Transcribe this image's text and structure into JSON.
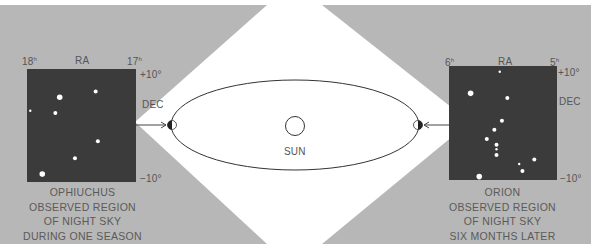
{
  "colors": {
    "background_gray": "#b7b7b7",
    "sky_panel": "#3b3b3b",
    "star": "#ffffff",
    "light_cone": "#ffffff",
    "orbit_line": "#444444",
    "text": "#555555"
  },
  "center": {
    "sun_label": "SUN"
  },
  "left_panel": {
    "ra_label": "RA",
    "ra_left_tick": "18",
    "ra_right_tick": "17",
    "ra_unit": "h",
    "dec_label": "DEC",
    "dec_top_tick": "+10°",
    "dec_bottom_tick": "−10°",
    "caption_lines": [
      "OPHIUCHUS",
      "OBSERVED REGION",
      "OF NIGHT SKY",
      "DURING ONE SEASON"
    ],
    "stars": [
      {
        "x": 0.3,
        "y": 0.25,
        "mag": 3
      },
      {
        "x": 0.63,
        "y": 0.2,
        "mag": 2
      },
      {
        "x": 0.03,
        "y": 0.37,
        "mag": 1
      },
      {
        "x": 0.26,
        "y": 0.39,
        "mag": 2
      },
      {
        "x": 0.65,
        "y": 0.64,
        "mag": 2
      },
      {
        "x": 0.44,
        "y": 0.79,
        "mag": 2
      },
      {
        "x": 0.14,
        "y": 0.93,
        "mag": 3
      }
    ]
  },
  "right_panel": {
    "ra_label": "RA",
    "ra_left_tick": "6",
    "ra_right_tick": "5",
    "ra_unit": "h",
    "dec_label": "DEC",
    "dec_top_tick": "+10°",
    "dec_bottom_tick": "−10°",
    "caption_lines": [
      "ORION",
      "OBSERVED REGION",
      "OF NIGHT SKY",
      "SIX MONTHS LATER"
    ],
    "stars": [
      {
        "x": 0.47,
        "y": 0.05,
        "mag": 1
      },
      {
        "x": 0.2,
        "y": 0.24,
        "mag": 3
      },
      {
        "x": 0.54,
        "y": 0.28,
        "mag": 2
      },
      {
        "x": 0.49,
        "y": 0.48,
        "mag": 2
      },
      {
        "x": 0.42,
        "y": 0.56,
        "mag": 2
      },
      {
        "x": 0.35,
        "y": 0.64,
        "mag": 2
      },
      {
        "x": 0.44,
        "y": 0.69,
        "mag": 2
      },
      {
        "x": 0.44,
        "y": 0.73,
        "mag": 1
      },
      {
        "x": 0.44,
        "y": 0.78,
        "mag": 2
      },
      {
        "x": 0.79,
        "y": 0.82,
        "mag": 2
      },
      {
        "x": 0.65,
        "y": 0.86,
        "mag": 1
      },
      {
        "x": 0.68,
        "y": 0.92,
        "mag": 2
      },
      {
        "x": 0.28,
        "y": 0.97,
        "mag": 3
      }
    ]
  }
}
